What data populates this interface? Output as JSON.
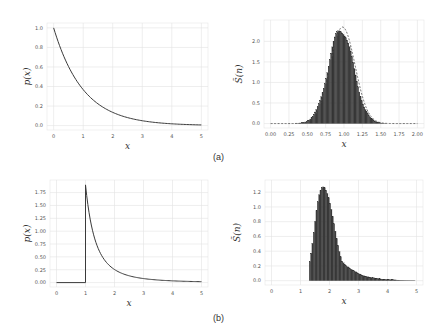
{
  "captions": {
    "a": "(a)",
    "b": "(b)"
  },
  "chart_data": [
    {
      "id": "a-left",
      "type": "line",
      "title": "",
      "xlabel": "x",
      "ylabel": "p(x)",
      "xlim": [
        0,
        5
      ],
      "ylim": [
        0,
        1.0
      ],
      "xticks": [
        "0",
        "1",
        "2",
        "3",
        "4",
        "5"
      ],
      "yticks": [
        "0.0",
        "0.2",
        "0.4",
        "0.6",
        "0.8",
        "1.0"
      ],
      "grid": true,
      "function": "exp(-x)",
      "x": [
        0,
        0.5,
        1,
        1.5,
        2,
        2.5,
        3,
        3.5,
        4,
        4.5,
        5
      ],
      "y": [
        1.0,
        0.61,
        0.37,
        0.22,
        0.14,
        0.08,
        0.05,
        0.03,
        0.02,
        0.01,
        0.007
      ]
    },
    {
      "id": "a-right",
      "type": "bar",
      "title": "",
      "xlabel": "x",
      "ylabel": "S̃_(n)",
      "xlim": [
        0,
        2.0
      ],
      "ylim": [
        0,
        2.4
      ],
      "xticks": [
        "0.00",
        "0.25",
        "0.50",
        "0.75",
        "1.00",
        "1.25",
        "1.50",
        "1.75",
        "2.00"
      ],
      "yticks": [
        "0.0",
        "0.5",
        "1.0",
        "1.5",
        "2.0"
      ],
      "grid": true,
      "overlay": "dashed normal density curve",
      "x": [
        0.5,
        0.6,
        0.7,
        0.75,
        0.8,
        0.85,
        0.9,
        0.95,
        1.0,
        1.05,
        1.1,
        1.15,
        1.2,
        1.25,
        1.3,
        1.4,
        1.5,
        1.6
      ],
      "values": [
        0.05,
        0.15,
        0.45,
        0.75,
        1.15,
        1.6,
        2.05,
        2.35,
        2.25,
        1.95,
        1.55,
        1.1,
        0.7,
        0.45,
        0.25,
        0.1,
        0.04,
        0.01
      ]
    },
    {
      "id": "b-left",
      "type": "line",
      "title": "",
      "xlabel": "x",
      "ylabel": "p(x)",
      "xlim": [
        0,
        5
      ],
      "ylim": [
        0,
        1.9
      ],
      "xticks": [
        "0",
        "1",
        "2",
        "3",
        "4",
        "5"
      ],
      "yticks": [
        "0.00",
        "0.25",
        "0.50",
        "0.75",
        "1.00",
        "1.25",
        "1.50",
        "1.75"
      ],
      "grid": true,
      "function": "Pareto: 0 for x<1, jumps to ~1.9 at x=1 then decays",
      "x": [
        0,
        1,
        1,
        1.25,
        1.5,
        2,
        2.5,
        3,
        4,
        5
      ],
      "y": [
        0,
        0,
        1.9,
        0.95,
        0.55,
        0.24,
        0.13,
        0.08,
        0.04,
        0.02
      ]
    },
    {
      "id": "b-right",
      "type": "bar",
      "title": "",
      "xlabel": "x",
      "ylabel": "S̃_(n)",
      "xlim": [
        0,
        5
      ],
      "ylim": [
        0,
        1.3
      ],
      "xticks": [
        "0",
        "1",
        "2",
        "3",
        "4",
        "5"
      ],
      "yticks": [
        "0.0",
        "0.2",
        "0.4",
        "0.6",
        "0.8",
        "1.0",
        "1.2"
      ],
      "grid": true,
      "x": [
        1.3,
        1.4,
        1.5,
        1.6,
        1.7,
        1.8,
        1.9,
        2.0,
        2.1,
        2.2,
        2.3,
        2.4,
        2.6,
        2.8,
        3.0,
        3.3,
        3.6,
        4.0,
        4.5,
        4.9
      ],
      "values": [
        0.02,
        0.2,
        0.55,
        0.95,
        1.2,
        1.3,
        1.2,
        1.0,
        0.8,
        0.62,
        0.48,
        0.38,
        0.25,
        0.17,
        0.12,
        0.07,
        0.05,
        0.03,
        0.02,
        0.01
      ]
    }
  ]
}
